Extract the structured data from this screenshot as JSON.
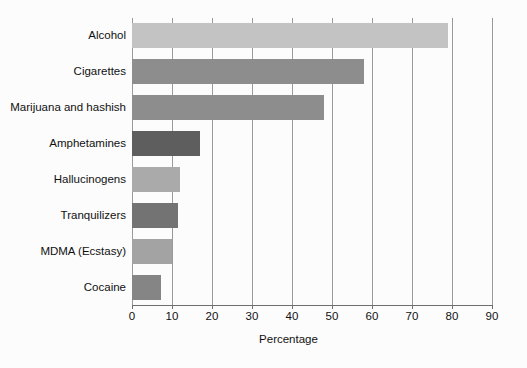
{
  "chart_data": {
    "type": "bar",
    "orientation": "horizontal",
    "title": "",
    "xlabel": "Percentage",
    "ylabel": "",
    "xlim": [
      0,
      90
    ],
    "xticks": [
      0,
      10,
      20,
      30,
      40,
      50,
      60,
      70,
      80,
      90
    ],
    "grid": "vertical",
    "legend": "none",
    "categories": [
      "Alcohol",
      "Cigarettes",
      "Marijuana and hashish",
      "Amphetamines",
      "Hallucinogens",
      "Tranquilizers",
      "MDMA (Ecstasy)",
      "Cocaine"
    ],
    "values": [
      79,
      58,
      48,
      17,
      12,
      11.5,
      10,
      7.3
    ],
    "bar_colors": [
      "#c3c3c3",
      "#8d8d8d",
      "#8d8d8d",
      "#5e5e5e",
      "#abaaaa",
      "#737373",
      "#a3a3a3",
      "#858585"
    ],
    "bars": [
      {
        "label": "Alcohol",
        "value": 79,
        "color": "#c3c3c3"
      },
      {
        "label": "Cigarettes",
        "value": 58,
        "color": "#8d8d8d"
      },
      {
        "label": "Marijuana and hashish",
        "value": 48,
        "color": "#8d8d8d"
      },
      {
        "label": "Amphetamines",
        "value": 17,
        "color": "#5e5e5e"
      },
      {
        "label": "Hallucinogens",
        "value": 12,
        "color": "#abaaaa"
      },
      {
        "label": "Tranquilizers",
        "value": 11.5,
        "color": "#737373"
      },
      {
        "label": "MDMA (Ecstasy)",
        "value": 10,
        "color": "#a3a3a3"
      },
      {
        "label": "Cocaine",
        "value": 7.3,
        "color": "#858585"
      }
    ]
  },
  "style": {
    "background": "#fcfcfc",
    "gridline_color": "#9a9a9a",
    "axis_color": "#6e6e6e",
    "text_color": "#111111"
  }
}
